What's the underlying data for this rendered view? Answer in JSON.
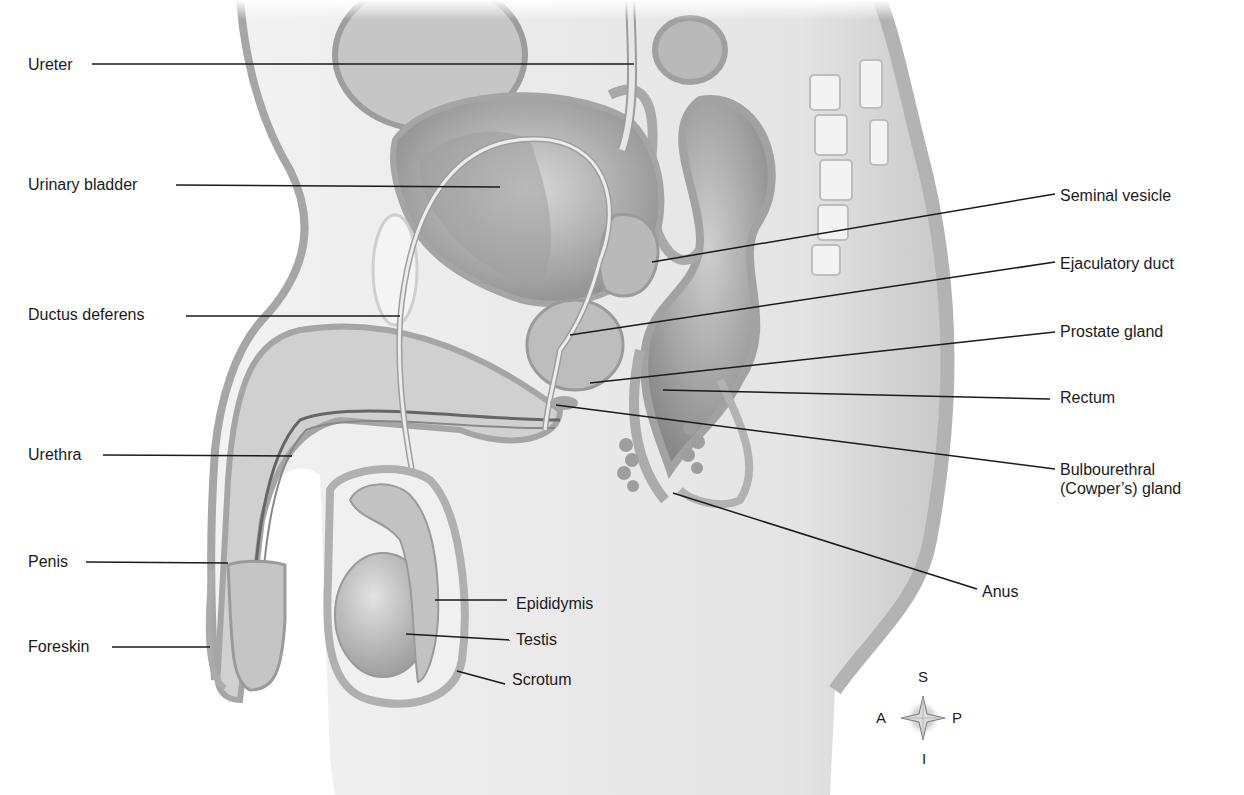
{
  "figure": {
    "type": "labeled anatomical illustration",
    "view": "midsagittal section, male pelvis",
    "colors": {
      "background": "#ffffff",
      "tissue_light": "#e6e6e6",
      "tissue_mid": "#c4c4c4",
      "tissue_dark": "#9a9a9a",
      "outline": "#8c8c8c",
      "leader_line": "#1a1a1a",
      "label_text": "#1a1a1a"
    }
  },
  "labels_left": [
    {
      "text": "Ureter",
      "x": 28,
      "y": 55,
      "line": [
        92,
        64,
        634,
        64
      ]
    },
    {
      "text": "Urinary bladder",
      "x": 28,
      "y": 175,
      "line": [
        176,
        185,
        500,
        187
      ]
    },
    {
      "text": "Ductus deferens",
      "x": 28,
      "y": 305,
      "line": [
        186,
        316,
        400,
        316
      ]
    },
    {
      "text": "Urethra",
      "x": 28,
      "y": 445,
      "line": [
        103,
        455,
        292,
        456
      ]
    },
    {
      "text": "Penis",
      "x": 28,
      "y": 552,
      "line": [
        86,
        562,
        228,
        563
      ]
    },
    {
      "text": "Foreskin",
      "x": 28,
      "y": 637,
      "line": [
        112,
        647,
        210,
        647
      ]
    }
  ],
  "labels_right": [
    {
      "text": "Seminal vesicle",
      "x": 1060,
      "y": 186,
      "line": [
        1055,
        194,
        652,
        262
      ]
    },
    {
      "text": "Ejaculatory duct",
      "x": 1060,
      "y": 254,
      "line": [
        1055,
        262,
        570,
        335
      ]
    },
    {
      "text": "Prostate gland",
      "x": 1060,
      "y": 322,
      "line": [
        1055,
        332,
        590,
        383
      ]
    },
    {
      "text": "Rectum",
      "x": 1060,
      "y": 388,
      "line": [
        1050,
        399,
        663,
        390
      ]
    },
    {
      "text": "Bulbourethral\n(Cowper’s) gland",
      "x": 1060,
      "y": 460,
      "line": [
        1055,
        469,
        556,
        405
      ]
    },
    {
      "text": "Anus",
      "x": 982,
      "y": 582,
      "line": [
        977,
        589,
        673,
        493
      ]
    }
  ],
  "labels_center": [
    {
      "text": "Epididymis",
      "x": 516,
      "y": 594,
      "line": [
        435,
        600,
        507,
        600
      ]
    },
    {
      "text": "Testis",
      "x": 516,
      "y": 630,
      "line": [
        406,
        634,
        510,
        640
      ]
    },
    {
      "text": "Scrotum",
      "x": 512,
      "y": 670,
      "line": [
        457,
        671,
        505,
        684
      ]
    }
  ],
  "compass": {
    "superior": "S",
    "inferior": "I",
    "anterior": "A",
    "posterior": "P",
    "icon": "compass-rose-icon"
  }
}
